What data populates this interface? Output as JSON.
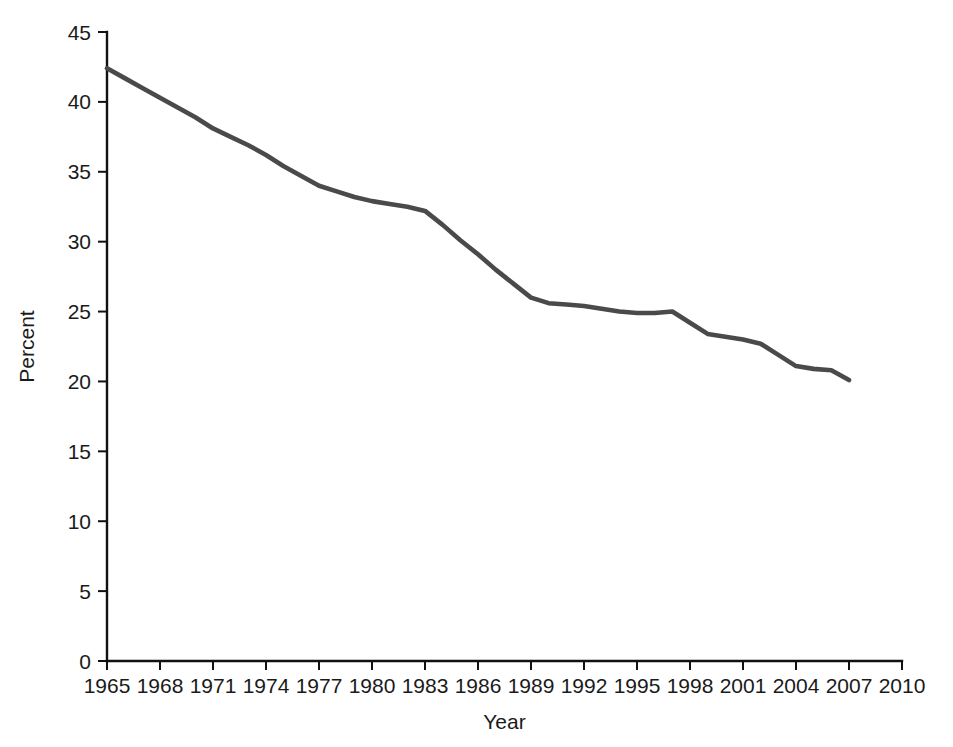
{
  "chart_data": {
    "type": "line",
    "title": "",
    "subtitle": "",
    "xlabel": "Year",
    "ylabel": "Percent",
    "xlim": [
      1965,
      2010
    ],
    "ylim": [
      0,
      45
    ],
    "grid": false,
    "legend": false,
    "legend_position": "none",
    "line_color": "#4a4a4a",
    "axis_color": "#111111",
    "background_color": "#ffffff",
    "x_ticks": [
      1965,
      1968,
      1971,
      1974,
      1977,
      1980,
      1983,
      1986,
      1989,
      1992,
      1995,
      1998,
      2001,
      2004,
      2007,
      2010
    ],
    "x_tick_labels": [
      "1965",
      "1968",
      "1971",
      "1974",
      "1977",
      "1980",
      "1983",
      "1986",
      "1989",
      "1992",
      "1995",
      "1998",
      "2001",
      "2004",
      "2007",
      "2010"
    ],
    "y_ticks": [
      0,
      5,
      10,
      15,
      20,
      25,
      30,
      35,
      40,
      45
    ],
    "y_tick_labels": [
      "0",
      "5",
      "10",
      "15",
      "20",
      "25",
      "30",
      "35",
      "40",
      "45"
    ],
    "series": [
      {
        "name": "Percent",
        "x": [
          1965,
          1966,
          1967,
          1968,
          1969,
          1970,
          1971,
          1972,
          1973,
          1974,
          1975,
          1976,
          1977,
          1978,
          1979,
          1980,
          1981,
          1982,
          1983,
          1984,
          1985,
          1986,
          1987,
          1988,
          1989,
          1990,
          1991,
          1992,
          1993,
          1994,
          1995,
          1996,
          1997,
          1998,
          1999,
          2000,
          2001,
          2002,
          2003,
          2004,
          2005,
          2006,
          2007
        ],
        "values": [
          42.4,
          41.7,
          41.0,
          40.3,
          39.6,
          38.9,
          38.1,
          37.5,
          36.9,
          36.2,
          35.4,
          34.7,
          34.0,
          33.6,
          33.2,
          32.9,
          32.7,
          32.5,
          32.2,
          31.2,
          30.1,
          29.1,
          28.0,
          27.0,
          26.0,
          25.6,
          25.5,
          25.4,
          25.2,
          25.0,
          24.9,
          24.9,
          25.0,
          24.2,
          23.4,
          23.2,
          23.0,
          22.7,
          21.9,
          21.1,
          20.9,
          20.8,
          20.1
        ]
      }
    ],
    "annotations": []
  },
  "axis": {
    "y_title": "Percent",
    "x_title": "Year"
  }
}
